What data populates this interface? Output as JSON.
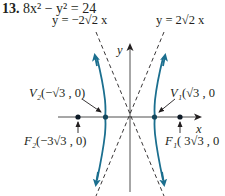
{
  "problem": {
    "number": "13.",
    "equation": "8x² − y² = 24"
  },
  "asymptotes": {
    "left": "y = −2√2 x",
    "right": "y = 2√2 x"
  },
  "axes": {
    "x_label": "x",
    "y_label": "y"
  },
  "points": {
    "v2": {
      "name": "V₂",
      "coords": "(−√3 , 0)"
    },
    "v1": {
      "name": "V₁",
      "coords": "(√3 , 0"
    },
    "f2": {
      "name": "F₂",
      "coords": "(−3√3 , 0)"
    },
    "f1": {
      "name": "F₁",
      "coords": "( 3√3 , 0"
    }
  },
  "colors": {
    "curve": "#1b6f8f",
    "axis": "#3a3a3a",
    "text": "#231f20",
    "points": "#0d1a26"
  }
}
